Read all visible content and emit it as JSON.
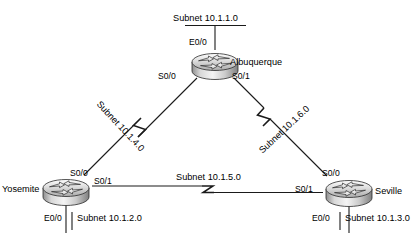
{
  "diagram": {
    "type": "network-topology",
    "title_ghost": "",
    "routers": [
      {
        "id": "albuquerque",
        "name": "Albuquerque",
        "interfaces": [
          {
            "id": "e00",
            "label": "E0/0"
          },
          {
            "id": "s00",
            "label": "S0/0"
          },
          {
            "id": "s01",
            "label": "S0/1"
          }
        ]
      },
      {
        "id": "yosemite",
        "name": "Yosemite",
        "interfaces": [
          {
            "id": "s00",
            "label": "S0/0"
          },
          {
            "id": "s01",
            "label": "S0/1"
          },
          {
            "id": "e00",
            "label": "E0/0"
          }
        ]
      },
      {
        "id": "seville",
        "name": "Seville",
        "interfaces": [
          {
            "id": "s00",
            "label": "S0/0"
          },
          {
            "id": "s01",
            "label": "S0/1"
          },
          {
            "id": "e00",
            "label": "E0/0"
          }
        ]
      }
    ],
    "subnets": [
      {
        "id": "lan1",
        "label": "Subnet 10.1.1.0",
        "kind": "ethernet",
        "attached": "albuquerque-e0/0"
      },
      {
        "id": "lan2",
        "label": "Subnet 10.1.2.0",
        "kind": "ethernet",
        "attached": "yosemite-e0/0"
      },
      {
        "id": "lan3",
        "label": "Subnet 10.1.3.0",
        "kind": "ethernet",
        "attached": "seville-e0/0"
      },
      {
        "id": "wan4",
        "label": "Subnet 10.1.4.0",
        "kind": "serial",
        "endpoints": [
          "albuquerque-s0/0",
          "yosemite-s0/0"
        ]
      },
      {
        "id": "wan5",
        "label": "Subnet 10.1.5.0",
        "kind": "serial",
        "endpoints": [
          "yosemite-s0/1",
          "seville-s0/1"
        ]
      },
      {
        "id": "wan6",
        "label": "Subnet 10.1.6.0",
        "kind": "serial",
        "endpoints": [
          "albuquerque-s0/1",
          "seville-s0/0"
        ]
      }
    ],
    "colors": {
      "line": "#1a1a1a",
      "text": "#000000",
      "router_light": "#f2f2f2",
      "router_mid": "#bdbdbd",
      "router_dark": "#8a8a8a",
      "background": "#ffffff"
    }
  }
}
